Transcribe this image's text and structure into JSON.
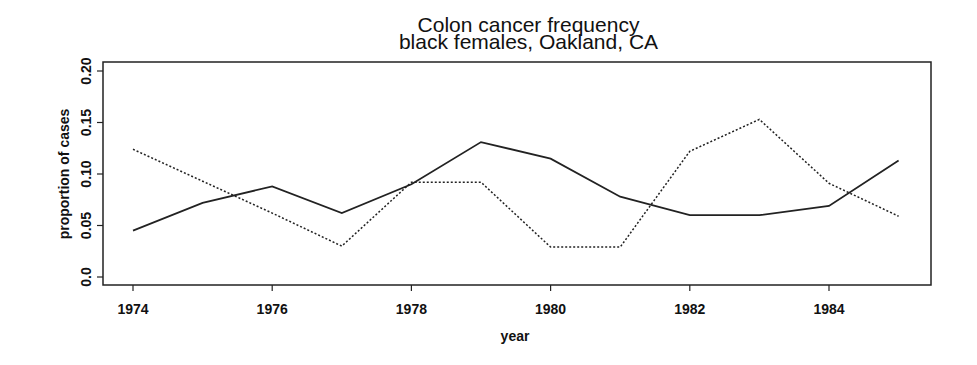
{
  "chart_data": {
    "type": "line",
    "title": "Colon cancer frequency",
    "subtitle": "black females,  Oakland, CA",
    "xlabel": "year",
    "ylabel": "proportion of cases",
    "x": [
      1974,
      1975,
      1976,
      1977,
      1978,
      1979,
      1980,
      1981,
      1982,
      1983,
      1984,
      1985
    ],
    "series": [
      {
        "name": "solid",
        "style": "solid",
        "values": [
          0.045,
          0.072,
          0.088,
          0.062,
          0.09,
          0.131,
          0.115,
          0.078,
          0.06,
          0.06,
          0.069,
          0.113
        ]
      },
      {
        "name": "dotted",
        "style": "dotted",
        "values": [
          0.124,
          0.093,
          0.062,
          0.03,
          0.092,
          0.092,
          0.029,
          0.029,
          0.122,
          0.153,
          0.091,
          0.059
        ]
      }
    ],
    "xticks": [
      1974,
      1976,
      1978,
      1980,
      1982,
      1984
    ],
    "yticks": [
      "0.0",
      "0.05",
      "0.10",
      "0.15",
      "0.20"
    ],
    "yticks_values": [
      0.0,
      0.05,
      0.1,
      0.15,
      0.2
    ],
    "xlim": [
      1973.6,
      1985.5
    ],
    "ylim": [
      -0.008,
      0.209
    ],
    "grid": false,
    "legend": null
  }
}
